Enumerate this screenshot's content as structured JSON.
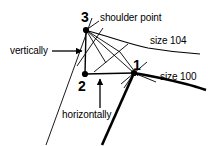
{
  "diagram": {
    "canvas": {
      "width": 208,
      "height": 146,
      "background": "#ffffff"
    },
    "ink_color": "#000000",
    "labels": {
      "shoulder_point": "shoulder point",
      "size_104": "size 104",
      "size_100": "size 100",
      "vertically": "vertically",
      "horizontally": "horizontally",
      "point_3": "3",
      "point_2": "2",
      "point_1": "1"
    },
    "points": [
      {
        "name": "point-3",
        "label": "3",
        "x": 86,
        "y": 30,
        "role": "shoulder point (graded up)"
      },
      {
        "name": "point-2",
        "label": "2",
        "x": 85,
        "y": 74,
        "role": "corner / reference point"
      },
      {
        "name": "point-1",
        "label": "1",
        "x": 134,
        "y": 73,
        "role": "shoulder point size 100"
      }
    ],
    "curves": [
      {
        "name": "size-104-curve",
        "label": "size 104",
        "weight": "thin"
      },
      {
        "name": "size-100-curve",
        "label": "size 100",
        "weight": "bold"
      }
    ],
    "annotations": [
      {
        "name": "vertically-arrow",
        "label": "vertically",
        "direction": "right",
        "points_to": "vertical segment between point 2 and point 3"
      },
      {
        "name": "horizontally-arrow",
        "label": "horizontally",
        "direction": "up",
        "points_to": "horizontal segment between point 2 and point 1"
      }
    ]
  }
}
